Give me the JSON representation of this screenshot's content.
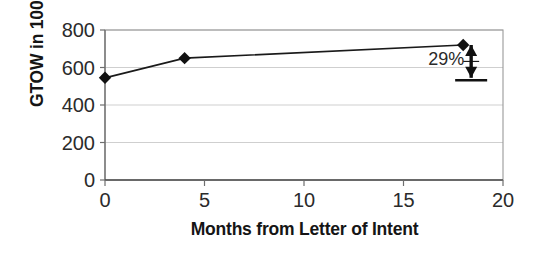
{
  "chart_data": {
    "type": "line",
    "title": "",
    "xlabel": "Months from Letter of Intent",
    "ylabel": "GTOW in 1000 lbs.",
    "x": [
      0,
      4,
      18
    ],
    "values": [
      545,
      650,
      720
    ],
    "series": [
      {
        "name": "GTOW",
        "x": [
          0,
          4,
          18
        ],
        "values": [
          545,
          650,
          720
        ]
      }
    ],
    "xlim": [
      0,
      20
    ],
    "ylim": [
      0,
      800
    ],
    "xticks": [
      0,
      5,
      10,
      15,
      20
    ],
    "yticks": [
      0,
      200,
      400,
      600,
      800
    ],
    "xtick_labels": [
      "0",
      "5",
      "10",
      "15",
      "20"
    ],
    "ytick_labels": [
      "0",
      "200",
      "400",
      "600",
      "800"
    ],
    "grid": {
      "horizontal": true,
      "vertical": false,
      "color": "#c9c9c9"
    },
    "legend": {
      "visible": false,
      "position": "none"
    },
    "marker": "diamond",
    "marker_color": "#111111",
    "line_color": "#1a1a1a",
    "annotations": [
      {
        "label": "29%",
        "type": "double-headed-arrow",
        "x": 18.4,
        "y_from": 545,
        "y_to": 720,
        "baseline_tick": true,
        "color": "#111111"
      }
    ]
  }
}
